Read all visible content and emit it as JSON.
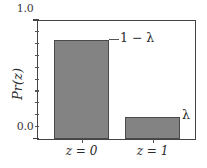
{
  "chart_data": {
    "type": "bar",
    "title": "",
    "xlabel": "",
    "ylabel": "Pr(z)",
    "categories": [
      "z = 0",
      "z = 1"
    ],
    "values": [
      0.84,
      0.19
    ],
    "ylim": [
      0.0,
      1.0
    ],
    "xlim": [
      0,
      2
    ],
    "grid": false,
    "legend": null,
    "bar_color": "#838383",
    "bar_edge_color": "#4a4a4a",
    "axis_color": "#444444",
    "y_ticks_major": [
      "0.0",
      "1.0"
    ],
    "y_ticks_major_values": [
      0.0,
      1.0
    ],
    "y_ticks_minor_values": [
      0.1,
      0.2,
      0.3,
      0.4,
      0.5,
      0.6,
      0.7,
      0.8,
      0.9
    ],
    "annotations": [
      {
        "text": "1 − λ",
        "target_category": "z = 0",
        "value": 0.84
      },
      {
        "text": "λ",
        "target_category": "z = 1",
        "value": 0.19
      }
    ]
  }
}
